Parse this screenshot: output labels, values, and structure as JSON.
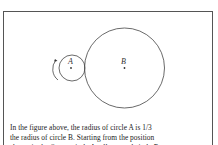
{
  "figure": {
    "circle_a": {
      "label": "A",
      "radius_ratio": "1/3"
    },
    "circle_b": {
      "label": "B"
    },
    "rotation_arrow": "counterclockwise-arrow-icon"
  },
  "caption": {
    "line1": "In the figure above, the radius of circle A is 1/3",
    "line2": "the radius of circle B. Starting from the position",
    "line3": "shown in the figure, circle A rolls around circle B"
  }
}
